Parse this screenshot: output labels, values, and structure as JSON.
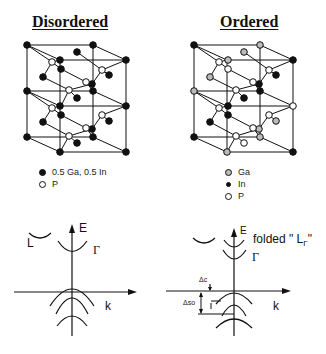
{
  "panels": {
    "left": {
      "title": "Disordered",
      "legend": [
        {
          "marker": "black-filled-circle",
          "label": "0.5 Ga, 0.5 In"
        },
        {
          "marker": "open-circle",
          "label": "P"
        }
      ],
      "band_diagram": {
        "energy_axis_label": "E",
        "momentum_axis_label": "k",
        "valley_labels": [
          "L",
          "Γ"
        ]
      }
    },
    "right": {
      "title": "Ordered",
      "legend": [
        {
          "marker": "hatched-gray-circle",
          "label": "Ga"
        },
        {
          "marker": "black-filled-circle",
          "label": "In"
        },
        {
          "marker": "open-circle",
          "label": "P"
        }
      ],
      "band_diagram": {
        "energy_axis_label": "E",
        "momentum_axis_label": "k",
        "valley_labels": [
          "Γ"
        ],
        "folded_label_prefix": "folded \" L",
        "folded_label_subscript": "Γ",
        "folded_label_suffix": "\"",
        "delta_c_label": "Δc",
        "delta_so_label": "Δso"
      }
    }
  }
}
